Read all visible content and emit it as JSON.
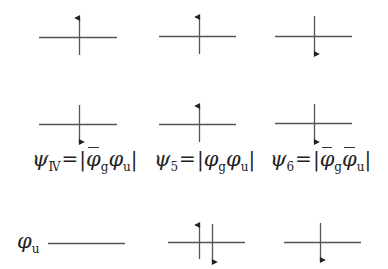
{
  "diagram": {
    "title": "",
    "colors": {
      "line": "#555555",
      "arrow": "#222222",
      "text": "#222222"
    },
    "configurations": [
      {
        "id": "row1-col1",
        "level": {
          "x1": 39,
          "x2": 117,
          "y": 37
        },
        "spins": [
          {
            "x": 79,
            "direction": "up",
            "y_top": 18,
            "y_bottom": 55
          }
        ]
      },
      {
        "id": "row1-col2",
        "level": {
          "x1": 159,
          "x2": 236,
          "y": 36
        },
        "spins": [
          {
            "x": 199,
            "direction": "up",
            "y_top": 17,
            "y_bottom": 54
          }
        ]
      },
      {
        "id": "row1-col3",
        "level": {
          "x1": 275,
          "x2": 352,
          "y": 36
        },
        "spins": [
          {
            "x": 314,
            "direction": "down",
            "y_top": 16,
            "y_bottom": 54
          }
        ]
      },
      {
        "id": "row2-col1",
        "level": {
          "x1": 39,
          "x2": 117,
          "y": 124
        },
        "spins": [
          {
            "x": 79,
            "direction": "down",
            "y_top": 105,
            "y_bottom": 142
          }
        ]
      },
      {
        "id": "row2-col2",
        "level": {
          "x1": 159,
          "x2": 236,
          "y": 124
        },
        "spins": [
          {
            "x": 199,
            "direction": "up",
            "y_top": 106,
            "y_bottom": 142
          }
        ]
      },
      {
        "id": "row2-col3",
        "level": {
          "x1": 275,
          "x2": 352,
          "y": 123
        },
        "spins": [
          {
            "x": 314,
            "direction": "down",
            "y_top": 104,
            "y_bottom": 142
          }
        ]
      },
      {
        "id": "row3-col1",
        "level": {
          "x1": 48,
          "x2": 125,
          "y": 243
        },
        "spins": []
      },
      {
        "id": "row3-col2",
        "level": {
          "x1": 168,
          "x2": 245,
          "y": 242
        },
        "spins": [
          {
            "x": 199,
            "direction": "up",
            "y_top": 225,
            "y_bottom": 259
          },
          {
            "x": 212,
            "direction": "down",
            "y_top": 224,
            "y_bottom": 262
          }
        ]
      },
      {
        "id": "row3-col3",
        "level": {
          "x1": 284,
          "x2": 361,
          "y": 242
        },
        "spins": [
          {
            "x": 320,
            "direction": "down",
            "y_top": 223,
            "y_bottom": 260
          }
        ]
      }
    ],
    "labels": {
      "psi4": {
        "psi": "ψ",
        "sub": "Ⅳ",
        "eq": "=",
        "bar_l": "|",
        "phi1": "φ",
        "phi1_bar": true,
        "sub1": "g",
        "phi2": "φ",
        "phi2_bar": false,
        "sub2": "u",
        "bar_r": "|"
      },
      "psi5": {
        "psi": "ψ",
        "sub": "5",
        "eq": "=",
        "bar_l": "|",
        "phi1": "φ",
        "phi1_bar": false,
        "sub1": "g",
        "phi2": "φ",
        "phi2_bar": false,
        "sub2": "u",
        "bar_r": "|"
      },
      "psi6": {
        "psi": "ψ",
        "sub": "6",
        "eq": "=",
        "bar_l": "|",
        "phi1": "φ",
        "phi1_bar": true,
        "sub1": "g",
        "phi2": "φ",
        "phi2_bar": true,
        "sub2": "u",
        "bar_r": "|"
      },
      "orbital_u": {
        "phi": "φ",
        "sub": "u"
      }
    }
  }
}
